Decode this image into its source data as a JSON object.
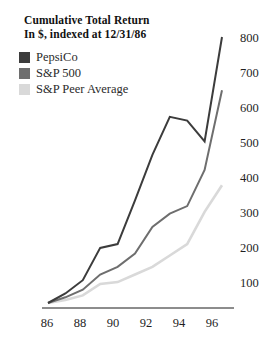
{
  "title": {
    "line1": "Cumulative Total Return",
    "line2": "In $, indexed at 12/31/86"
  },
  "legend": {
    "position": "top-left",
    "items": [
      {
        "label": "PepsiCo",
        "color": "#3c3c3c"
      },
      {
        "label": "S&P 500",
        "color": "#6e6e6e"
      },
      {
        "label": "S&P Peer Average",
        "color": "#d9d9d9"
      }
    ]
  },
  "axes": {
    "y_ticks": [
      "800",
      "700",
      "600",
      "500",
      "400",
      "300",
      "200",
      "100"
    ],
    "x_ticks": [
      "86",
      "88",
      "90",
      "92",
      "94",
      "96"
    ]
  },
  "chart_data": {
    "type": "line",
    "title": "Cumulative Total Return",
    "subtitle": "In $, indexed at 12/31/86",
    "xlabel": "",
    "ylabel": "",
    "xlim": [
      86,
      96
    ],
    "ylim": [
      100,
      800
    ],
    "grid": false,
    "legend_position": "top-left",
    "x": [
      86,
      87,
      88,
      89,
      90,
      91,
      92,
      93,
      94,
      95,
      96
    ],
    "x_tick_labels": [
      "86",
      "88",
      "90",
      "92",
      "94",
      "96"
    ],
    "y_tick_labels": [
      "100",
      "200",
      "300",
      "400",
      "500",
      "600",
      "700",
      "800"
    ],
    "series": [
      {
        "name": "PepsiCo",
        "color": "#3c3c3c",
        "values": [
          100,
          125,
          160,
          245,
          255,
          370,
          490,
          590,
          580,
          525,
          800
        ]
      },
      {
        "name": "S&P 500",
        "color": "#6e6e6e",
        "values": [
          100,
          115,
          135,
          175,
          195,
          230,
          300,
          335,
          355,
          450,
          660
        ]
      },
      {
        "name": "S&P Peer Average",
        "color": "#d9d9d9",
        "values": [
          100,
          108,
          120,
          150,
          155,
          175,
          195,
          225,
          255,
          340,
          410
        ]
      }
    ]
  }
}
